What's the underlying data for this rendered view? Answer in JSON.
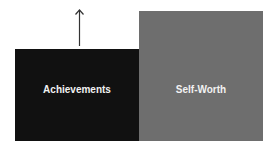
{
  "diagram": {
    "boxes": [
      {
        "label": "Achievements",
        "color": "#111111"
      },
      {
        "label": "Self-Worth",
        "color": "#6e6e6e"
      }
    ],
    "arrow": {
      "direction": "up",
      "color": "#333333"
    }
  }
}
